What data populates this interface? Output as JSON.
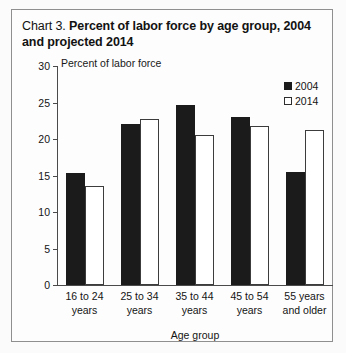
{
  "chart_data": {
    "type": "bar",
    "title": "Chart 3.  Percent of labor force by age group, 2004 and projected 2014",
    "title_prefix": "Chart 3.",
    "title_main": "Percent of labor force by age group, 2004 and projected 2014",
    "xlabel": "Age group",
    "ylabel": "Percent of labor force",
    "categories": [
      "16 to 24 years",
      "25 to 34 years",
      "35 to 44 years",
      "45 to 54 years",
      "55 years and older"
    ],
    "category_lines": [
      [
        "16 to 24",
        "years"
      ],
      [
        "25 to 34",
        "years"
      ],
      [
        "35 to 44",
        "years"
      ],
      [
        "45 to 54",
        "years"
      ],
      [
        "55 years",
        "and older"
      ]
    ],
    "series": [
      {
        "name": "2004",
        "color": "#1b1b1b",
        "values": [
          15.4,
          22.1,
          24.7,
          23.0,
          15.5
        ]
      },
      {
        "name": "2014",
        "color": "#ffffff",
        "values": [
          13.6,
          22.7,
          20.5,
          21.8,
          21.3
        ]
      }
    ],
    "ylim": [
      0,
      30
    ],
    "yticks": [
      0,
      5,
      10,
      15,
      20,
      25,
      30
    ],
    "ytick_labels": [
      "0",
      "5",
      "10",
      "15",
      "20",
      "25",
      "30"
    ],
    "grid": false,
    "legend_position": "top-right",
    "legend": [
      "2004",
      "2014"
    ]
  }
}
